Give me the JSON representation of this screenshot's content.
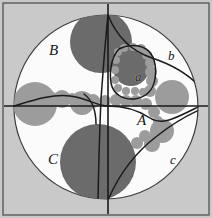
{
  "figure": {
    "type": "kleinian-limit-set-circle-packing",
    "canvas": {
      "width": 212,
      "height": 218
    },
    "background_color": "#ffffff",
    "plate_color": "#c9c9c9",
    "disk_color": "#fbfbfb",
    "frame_color": "#5a5a5a",
    "curve_color": "#1a1a1a",
    "dark_circle_color": "#6b6b6b",
    "mid_circle_color": "#9c9c9c",
    "axes": {
      "vertical_x": 108,
      "horizontal_y": 106,
      "color": "#1a1a1a",
      "width": 1.6
    },
    "main_disk": {
      "cx": 106,
      "cy": 107,
      "r": 92,
      "stroke": "#3c3c3c"
    },
    "frame": {
      "x": 3,
      "y": 3,
      "width": 206,
      "height": 212
    }
  },
  "labels": [
    {
      "id": "region-B",
      "text": "B",
      "x": 49,
      "y": 43,
      "size": "major"
    },
    {
      "id": "region-b",
      "text": "b",
      "x": 168,
      "y": 49,
      "size": "minor"
    },
    {
      "id": "region-a",
      "text": "a",
      "x": 135,
      "y": 70,
      "size": "minor"
    },
    {
      "id": "region-A",
      "text": "A",
      "x": 137,
      "y": 113,
      "size": "major"
    },
    {
      "id": "region-C",
      "text": "C",
      "x": 48,
      "y": 152,
      "size": "major"
    },
    {
      "id": "region-c",
      "text": "c",
      "x": 170,
      "y": 153,
      "size": "minor"
    }
  ],
  "dark_circles": [
    {
      "cx": 101,
      "cy": 42,
      "r": 31
    },
    {
      "cx": 98,
      "cy": 162,
      "r": 38
    },
    {
      "cx": 131,
      "cy": 68,
      "r": 18
    }
  ],
  "mid_circles": [
    {
      "cx": 35,
      "cy": 104,
      "r": 22
    },
    {
      "cx": 172,
      "cy": 97,
      "r": 17
    },
    {
      "cx": 82,
      "cy": 103,
      "r": 12
    },
    {
      "cx": 62,
      "cy": 99,
      "r": 9
    },
    {
      "cx": 162,
      "cy": 131,
      "r": 12
    },
    {
      "cx": 152,
      "cy": 144,
      "r": 8
    }
  ],
  "chain_circles": [
    {
      "cx": 93,
      "cy": 101,
      "r": 7
    },
    {
      "cx": 105,
      "cy": 101,
      "r": 6
    },
    {
      "cx": 116,
      "cy": 100,
      "r": 6
    },
    {
      "cx": 126,
      "cy": 101,
      "r": 6
    },
    {
      "cx": 136,
      "cy": 101,
      "r": 6
    },
    {
      "cx": 146,
      "cy": 104,
      "r": 6
    },
    {
      "cx": 154,
      "cy": 112,
      "r": 6
    },
    {
      "cx": 158,
      "cy": 121,
      "r": 5
    },
    {
      "cx": 145,
      "cy": 136,
      "r": 6
    },
    {
      "cx": 137,
      "cy": 143,
      "r": 6
    },
    {
      "cx": 72,
      "cy": 99,
      "r": 6
    },
    {
      "cx": 52,
      "cy": 97,
      "r": 5
    },
    {
      "cx": 45,
      "cy": 95,
      "r": 4
    },
    {
      "cx": 150,
      "cy": 91,
      "r": 6
    },
    {
      "cx": 152,
      "cy": 81,
      "r": 6
    },
    {
      "cx": 151,
      "cy": 72,
      "r": 6
    },
    {
      "cx": 150,
      "cy": 63,
      "r": 5
    },
    {
      "cx": 147,
      "cy": 55,
      "r": 5
    },
    {
      "cx": 141,
      "cy": 49,
      "r": 5
    },
    {
      "cx": 133,
      "cy": 47,
      "r": 4
    },
    {
      "cx": 124,
      "cy": 48,
      "r": 4
    },
    {
      "cx": 118,
      "cy": 52,
      "r": 4
    },
    {
      "cx": 116,
      "cy": 60,
      "r": 4
    },
    {
      "cx": 115,
      "cy": 70,
      "r": 4
    },
    {
      "cx": 115,
      "cy": 80,
      "r": 4
    },
    {
      "cx": 118,
      "cy": 88,
      "r": 4
    },
    {
      "cx": 126,
      "cy": 91,
      "r": 4
    },
    {
      "cx": 135,
      "cy": 91,
      "r": 4
    },
    {
      "cx": 143,
      "cy": 92,
      "r": 4
    }
  ],
  "curves": [
    {
      "id": "curve-upper-right-arc",
      "d": "M 108 15 C 118 40 134 52 152 58 C 170 64 186 72 199 86"
    },
    {
      "id": "curve-a-cell",
      "d": "M 119 49 C 126 45 137 44 146 49 C 154 54 157 66 155 79 C 153 92 144 98 134 99 C 123 100 113 94 111 83 C 109 70 112 56 119 49 Z"
    },
    {
      "id": "curve-left-wave",
      "d": "M 14 106 C 34 100 52 94 70 96 C 88 98 96 106 108 106"
    },
    {
      "id": "curve-right-wave",
      "d": "M 108 106 C 124 106 138 110 150 118 C 162 126 176 118 200 106"
    },
    {
      "id": "curve-down-mid",
      "d": "M 101 100 C 100 120 99 150 98 200"
    },
    {
      "id": "curve-lower-right-arc",
      "d": "M 108 200 C 120 172 136 152 157 136 C 172 124 186 116 199 110"
    },
    {
      "id": "curve-upper-left-branch",
      "d": "M 108 14 C 105 45 103 70 101 99"
    },
    {
      "id": "curve-small-left",
      "d": "M 84 94 C 92 100 96 110 96 124"
    }
  ]
}
